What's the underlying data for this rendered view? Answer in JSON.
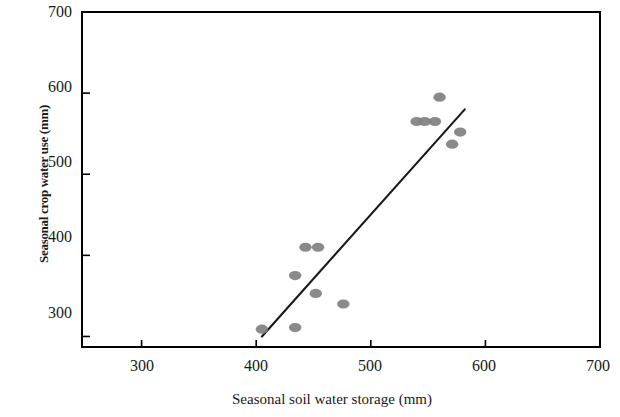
{
  "chart_data": {
    "type": "scatter",
    "title": "",
    "xlabel": "Seasonal soil water storage (mm)",
    "ylabel": "Seasonal crop water use (mm)",
    "xlim": [
      248,
      700
    ],
    "ylim": [
      287,
      700
    ],
    "xticks": [
      300,
      400,
      500,
      600,
      700
    ],
    "yticks": [
      300,
      400,
      500,
      600,
      700
    ],
    "xtick_labels": [
      "300",
      "400",
      "500",
      "600",
      "700"
    ],
    "ytick_labels": [
      "300",
      "400",
      "500",
      "600",
      "700"
    ],
    "grid": false,
    "legend": null,
    "marker_color": "#808080",
    "line_color": "#1a1a1a",
    "frame_color": "#000000",
    "points": [
      {
        "x": 405,
        "y": 309
      },
      {
        "x": 434,
        "y": 311
      },
      {
        "x": 434,
        "y": 375
      },
      {
        "x": 443,
        "y": 410
      },
      {
        "x": 454,
        "y": 410
      },
      {
        "x": 452,
        "y": 353
      },
      {
        "x": 476,
        "y": 340
      },
      {
        "x": 540,
        "y": 565
      },
      {
        "x": 547,
        "y": 565
      },
      {
        "x": 556,
        "y": 565
      },
      {
        "x": 560,
        "y": 595
      },
      {
        "x": 571,
        "y": 537
      },
      {
        "x": 578,
        "y": 552
      }
    ],
    "series": [
      {
        "name": "observations",
        "type": "scatter",
        "values": [
          [
            405,
            309
          ],
          [
            434,
            311
          ],
          [
            434,
            375
          ],
          [
            443,
            410
          ],
          [
            454,
            410
          ],
          [
            452,
            353
          ],
          [
            476,
            340
          ],
          [
            540,
            565
          ],
          [
            547,
            565
          ],
          [
            556,
            565
          ],
          [
            560,
            595
          ],
          [
            571,
            537
          ],
          [
            578,
            552
          ]
        ]
      },
      {
        "name": "regression-line",
        "type": "line",
        "values": [
          [
            405,
            300
          ],
          [
            582,
            580
          ]
        ]
      }
    ],
    "trendline": {
      "x0": 405,
      "y0": 300,
      "x1": 582,
      "y1": 580
    }
  },
  "axes": {
    "x": {
      "title": "Seasonal soil water storage (mm)",
      "ticks": [
        {
          "value": 300,
          "label": "300"
        },
        {
          "value": 400,
          "label": "400"
        },
        {
          "value": 500,
          "label": "500"
        },
        {
          "value": 600,
          "label": "600"
        },
        {
          "value": 700,
          "label": "700"
        }
      ]
    },
    "y": {
      "title": "Seasonal crop water use (mm)",
      "ticks": [
        {
          "value": 300,
          "label": "300"
        },
        {
          "value": 400,
          "label": "400"
        },
        {
          "value": 500,
          "label": "500"
        },
        {
          "value": 600,
          "label": "600"
        },
        {
          "value": 700,
          "label": "700"
        }
      ]
    }
  }
}
